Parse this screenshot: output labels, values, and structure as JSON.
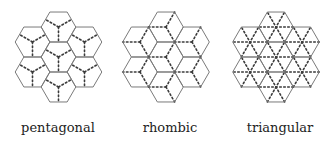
{
  "diagram": {
    "hex_side": 17.3,
    "stroke_color": "#7a7a7a",
    "dot_color": "#3a3a3a",
    "panels": [
      {
        "id": "pentagonal",
        "label": "pentagonal",
        "center_x": 58.5,
        "label_x": 58,
        "pattern": "pentagonal"
      },
      {
        "id": "rhombic",
        "label": "rhombic",
        "center_x": 166,
        "label_x": 170,
        "pattern": "rhombic"
      },
      {
        "id": "triangular",
        "label": "triangular",
        "center_x": 276,
        "label_x": 280,
        "pattern": "triangular"
      }
    ],
    "hex_layout": {
      "center_column_y": [
        27,
        57,
        87
      ],
      "side_column_y": [
        42,
        72
      ],
      "side_column_dx": 26
    }
  }
}
